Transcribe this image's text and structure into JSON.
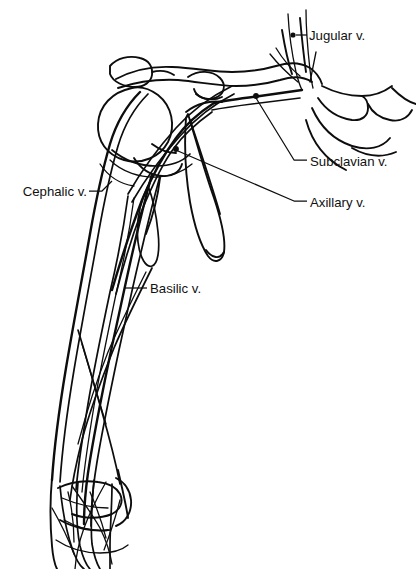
{
  "figure": {
    "background_color": "#ffffff",
    "ink_color": "#0d0d0d",
    "width": 416,
    "height": 569,
    "style": "black-and-white line drawing"
  },
  "labels": [
    {
      "id": "jugular",
      "text": "Jugular v.",
      "icon": "dot-leader-pointer",
      "text_x": 308,
      "text_y": 40,
      "anchor": "start",
      "marker": {
        "x": 293,
        "y": 35,
        "r": 2.6
      },
      "leader": "M 296 35 L 307 35"
    },
    {
      "id": "subclavian",
      "text": "Subclavian v.",
      "icon": "line-leader-pointer",
      "text_x": 310,
      "text_y": 167,
      "anchor": "start",
      "marker": {
        "x": 256,
        "y": 96,
        "r": 2.9
      },
      "leader": "M 256 97 L 295 160 L 308 160"
    },
    {
      "id": "axillary",
      "text": "Axillary v.",
      "icon": "line-leader-pointer",
      "text_x": 310,
      "text_y": 208,
      "anchor": "start",
      "marker": {
        "x": 176,
        "y": 149,
        "r": 2.9
      },
      "leader": "M 177 150 L 295 201 L 308 201"
    },
    {
      "id": "cephalic",
      "text": "Cephalic v.",
      "icon": "line-leader-pointer",
      "text_x": 86,
      "text_y": 197,
      "anchor": "end",
      "marker": null,
      "leader": "M 89 191 L 101 191 L 110 182"
    },
    {
      "id": "basilic",
      "text": "Basilic v.",
      "icon": "line-leader-pointer",
      "text_x": 150,
      "text_y": 293,
      "anchor": "start",
      "marker": null,
      "leader": "M 125 288 L 147 288"
    }
  ],
  "structures": [
    {
      "id": "clavicle",
      "name": "clavicle"
    },
    {
      "id": "acromion",
      "name": "acromion"
    },
    {
      "id": "humeral-head",
      "name": "humeral head"
    },
    {
      "id": "scapula",
      "name": "scapula"
    },
    {
      "id": "humerus-shaft",
      "name": "humerus shaft"
    },
    {
      "id": "sternum-ribs",
      "name": "sternum and upper ribs"
    },
    {
      "id": "distal-forearm",
      "name": "distal forearm and wrist"
    },
    {
      "id": "jugular-veins",
      "name": "jugular veins"
    },
    {
      "id": "subclavian-vein",
      "name": "subclavian vein"
    },
    {
      "id": "axillary-vein",
      "name": "axillary vein"
    },
    {
      "id": "cephalic-vein",
      "name": "cephalic vein"
    },
    {
      "id": "basilic-vein",
      "name": "basilic vein"
    },
    {
      "id": "forearm-vein-network",
      "name": "forearm superficial vein network"
    }
  ]
}
